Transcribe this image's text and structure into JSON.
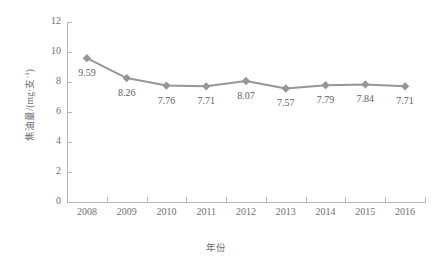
{
  "chart_data": {
    "type": "line",
    "title": "",
    "xlabel": "年份",
    "ylabel": "焦油量/(mg·支-1)",
    "ylabel_main": "焦油量/(mg·支",
    "ylabel_sup": "-1",
    "ylabel_tail": ")",
    "categories": [
      "2008",
      "2009",
      "2010",
      "2011",
      "2012",
      "2013",
      "2014",
      "2015",
      "2016"
    ],
    "values": [
      9.59,
      8.26,
      7.76,
      7.71,
      8.07,
      7.57,
      7.79,
      7.84,
      7.71
    ],
    "data_labels": [
      "9.59",
      "8.26",
      "7.76",
      "7.71",
      "8.07",
      "7.57",
      "7.79",
      "7.84",
      "7.71"
    ],
    "ylim": [
      0,
      12
    ],
    "yticks": [
      0,
      2,
      4,
      6,
      8,
      10,
      12
    ],
    "ytick_labels": [
      "0",
      "2",
      "4",
      "6",
      "8",
      "10",
      "12"
    ],
    "grid": false,
    "legend": "none",
    "series_color": "#969696",
    "marker": "diamond",
    "axis_color": "#b5b5b5",
    "text_color": "#6f6f6f"
  }
}
